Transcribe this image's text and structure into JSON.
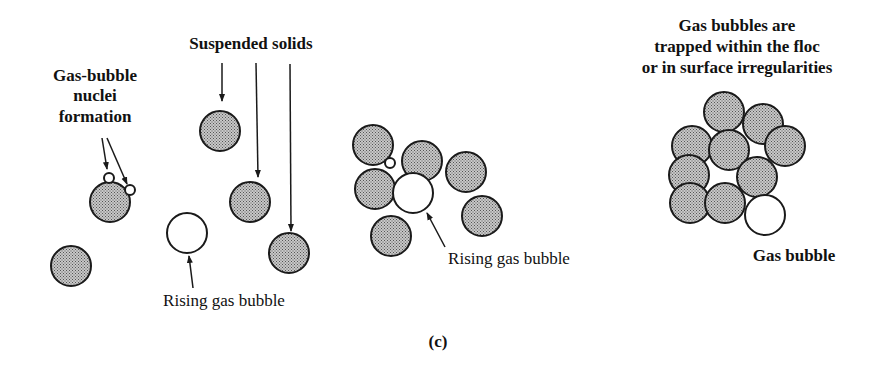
{
  "labels": {
    "suspended_solids": "Suspended solids",
    "nuclei_line1": "Gas-bubble",
    "nuclei_line2": "nuclei",
    "nuclei_line3": "formation",
    "rising_bubble_1": "Rising gas bubble",
    "rising_bubble_2": "Rising gas bubble",
    "trapped_line1": "Gas bubbles are",
    "trapped_line2": "trapped within the floc",
    "trapped_line3": "or in surface irregularities",
    "gas_bubble": "Gas bubble",
    "panel": "(c)"
  },
  "colors": {
    "particle_fill": "#b5b5b5",
    "stroke": "#1a1a1a",
    "bubble_fill": "#ffffff"
  }
}
